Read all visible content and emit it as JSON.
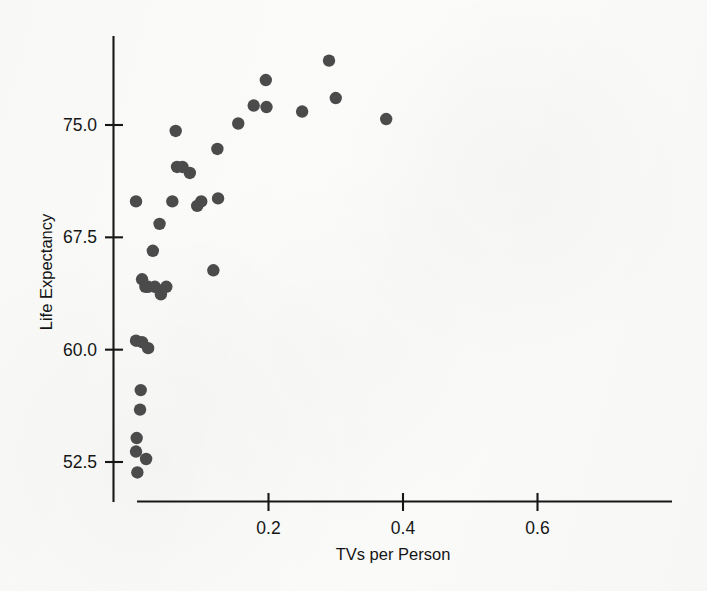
{
  "chart_data": {
    "type": "scatter",
    "title": "",
    "xlabel": "TVs per Person",
    "ylabel": "Life Expectancy",
    "xlim": [
      0.0,
      0.78
    ],
    "ylim": [
      50.0,
      80.5
    ],
    "xticks": [
      0.2,
      0.4,
      0.6
    ],
    "xtick_labels": [
      "0.2",
      "0.4",
      "0.6"
    ],
    "yticks": [
      52.5,
      60.0,
      67.5,
      75.0
    ],
    "ytick_labels": [
      "52.5",
      "60.0",
      "67.5",
      "75.0"
    ],
    "grid": false,
    "legend": false,
    "marker": {
      "shape": "circle",
      "color": "#4b4b4b",
      "radius_px": 6.2
    },
    "axis_color": "#171717",
    "background_color": "#fbfbfa",
    "n_points": 36,
    "series": [
      {
        "name": "Countries",
        "points": [
          {
            "x": 0.005,
            "y": 51.8
          },
          {
            "x": 0.003,
            "y": 53.2
          },
          {
            "x": 0.004,
            "y": 54.1
          },
          {
            "x": 0.018,
            "y": 52.7
          },
          {
            "x": 0.009,
            "y": 56.0
          },
          {
            "x": 0.01,
            "y": 57.3
          },
          {
            "x": 0.003,
            "y": 60.6
          },
          {
            "x": 0.012,
            "y": 60.5
          },
          {
            "x": 0.021,
            "y": 60.1
          },
          {
            "x": 0.012,
            "y": 64.7
          },
          {
            "x": 0.017,
            "y": 64.2
          },
          {
            "x": 0.021,
            "y": 64.2
          },
          {
            "x": 0.031,
            "y": 64.2
          },
          {
            "x": 0.04,
            "y": 63.7
          },
          {
            "x": 0.048,
            "y": 64.2
          },
          {
            "x": 0.003,
            "y": 69.9
          },
          {
            "x": 0.038,
            "y": 68.4
          },
          {
            "x": 0.028,
            "y": 66.6
          },
          {
            "x": 0.057,
            "y": 69.9
          },
          {
            "x": 0.094,
            "y": 69.6
          },
          {
            "x": 0.083,
            "y": 71.8
          },
          {
            "x": 0.064,
            "y": 72.2
          },
          {
            "x": 0.072,
            "y": 72.2
          },
          {
            "x": 0.1,
            "y": 69.9
          },
          {
            "x": 0.062,
            "y": 74.6
          },
          {
            "x": 0.118,
            "y": 65.3
          },
          {
            "x": 0.124,
            "y": 73.4
          },
          {
            "x": 0.125,
            "y": 70.1
          },
          {
            "x": 0.155,
            "y": 75.1
          },
          {
            "x": 0.178,
            "y": 76.3
          },
          {
            "x": 0.196,
            "y": 78.0
          },
          {
            "x": 0.197,
            "y": 76.2
          },
          {
            "x": 0.29,
            "y": 79.3
          },
          {
            "x": 0.3,
            "y": 76.8
          },
          {
            "x": 0.375,
            "y": 75.4
          },
          {
            "x": 0.25,
            "y": 75.9
          }
        ]
      }
    ]
  },
  "axis_labels": {
    "x_title": "TVs per Person",
    "y_title": "Life Expectancy"
  }
}
